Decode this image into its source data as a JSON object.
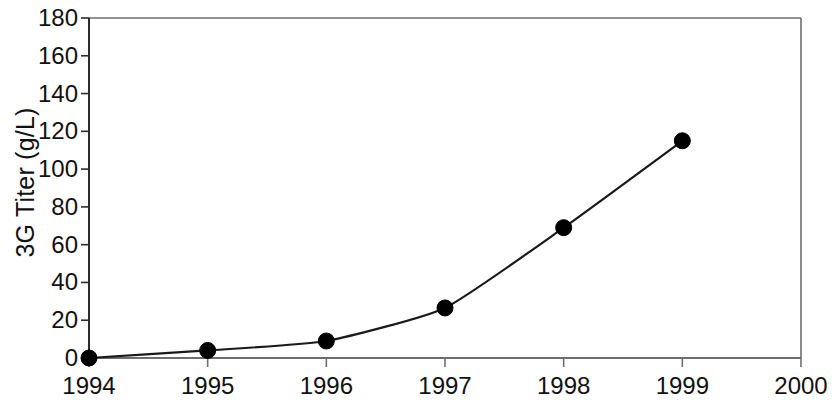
{
  "chart_data": {
    "type": "line",
    "title": "",
    "subtitle": "",
    "xlabel": "",
    "ylabel": "3G Titer (g/L)",
    "x": [
      1994,
      1995,
      1996,
      1997,
      1998,
      1999
    ],
    "values": [
      0,
      4,
      9,
      26.5,
      69,
      115
    ],
    "series": [
      {
        "name": "3G Titer",
        "x": [
          1994,
          1995,
          1996,
          1997,
          1998,
          1999
        ],
        "values": [
          0,
          4,
          9,
          26.5,
          69,
          115
        ]
      }
    ],
    "xlim": [
      1994,
      2000
    ],
    "ylim": [
      0,
      180
    ],
    "xticks": [
      1994,
      1995,
      1996,
      1997,
      1998,
      1999,
      2000
    ],
    "xtick_labels": [
      "1994",
      "1995",
      "1996",
      "1997",
      "1998",
      "1999",
      "2000"
    ],
    "yticks": [
      0,
      20,
      40,
      60,
      80,
      100,
      120,
      140,
      160,
      180
    ],
    "ytick_labels": [
      "0",
      "20",
      "40",
      "60",
      "80",
      "100",
      "120",
      "140",
      "160",
      "180"
    ],
    "grid": false,
    "legend": false,
    "legend_position": "none",
    "line_color": "#1a1a1a",
    "marker_color": "#000000",
    "marker_shape": "circle",
    "axis_color": "#6e6e6e",
    "background_color": "#ffffff",
    "annotations": []
  }
}
